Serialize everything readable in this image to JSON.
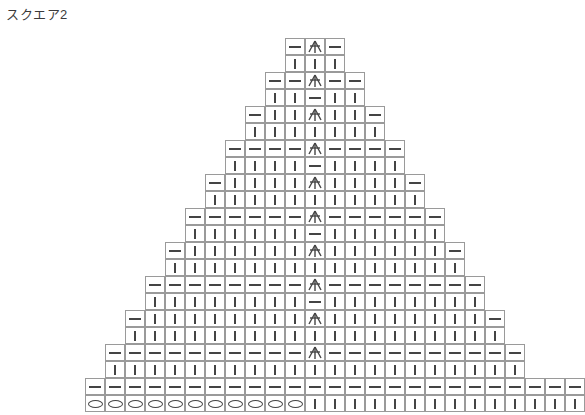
{
  "title": "スクエア2",
  "colors": {
    "background": "#ffffff",
    "grid_line": "#9a9a9a",
    "symbol": "#444444",
    "title_text": "#3a3a3a"
  },
  "symbols": {
    "dash": {
      "name": "half-double-crochet-dash",
      "glyph": "—"
    },
    "bar": {
      "name": "single-crochet-bar",
      "glyph": "|"
    },
    "oval": {
      "name": "chain-stitch-oval",
      "glyph": "O"
    },
    "decrease": {
      "name": "center-double-decrease",
      "glyph": "人"
    }
  },
  "chart_data": {
    "type": "table",
    "title": "スクエア2",
    "xlabel": "",
    "ylabel": "",
    "geometry": {
      "cell_width": 20,
      "cell_height": 17,
      "origin_x": 85,
      "origin_y": 38,
      "rows": 20,
      "left_columns": 11,
      "right_columns": 13,
      "center_column_index": 11
    },
    "legend": [
      {
        "symbol": "dash",
        "label": "—"
      },
      {
        "symbol": "bar",
        "label": "|"
      },
      {
        "symbol": "oval",
        "label": "O"
      },
      {
        "symbol": "decrease",
        "label": "人"
      }
    ],
    "grid": [
      {
        "row": 0,
        "left": [
          "dash"
        ],
        "center": "decrease",
        "right": [
          "dash"
        ]
      },
      {
        "row": 1,
        "left": [
          "bar"
        ],
        "center": "bar",
        "right": [
          "bar"
        ]
      },
      {
        "row": 2,
        "left": [
          "dash",
          "dash"
        ],
        "center": "decrease",
        "right": [
          "dash",
          "dash"
        ]
      },
      {
        "row": 3,
        "left": [
          "bar",
          "bar"
        ],
        "center": "dash",
        "right": [
          "bar",
          "bar"
        ]
      },
      {
        "row": 4,
        "left": [
          "dash",
          "bar",
          "bar"
        ],
        "center": "decrease",
        "right": [
          "bar",
          "bar",
          "dash"
        ]
      },
      {
        "row": 5,
        "left": [
          "bar",
          "bar",
          "bar"
        ],
        "center": "bar",
        "right": [
          "bar",
          "bar",
          "bar"
        ]
      },
      {
        "row": 6,
        "left": [
          "dash",
          "dash",
          "dash",
          "dash"
        ],
        "center": "decrease",
        "right": [
          "dash",
          "dash",
          "dash",
          "dash"
        ]
      },
      {
        "row": 7,
        "left": [
          "bar",
          "bar",
          "bar",
          "bar"
        ],
        "center": "dash",
        "right": [
          "bar",
          "bar",
          "bar",
          "bar"
        ]
      },
      {
        "row": 8,
        "left": [
          "dash",
          "bar",
          "bar",
          "bar",
          "bar"
        ],
        "center": "decrease",
        "right": [
          "bar",
          "bar",
          "bar",
          "bar",
          "dash"
        ]
      },
      {
        "row": 9,
        "left": [
          "bar",
          "bar",
          "bar",
          "bar",
          "bar"
        ],
        "center": "bar",
        "right": [
          "bar",
          "bar",
          "bar",
          "bar",
          "bar"
        ]
      },
      {
        "row": 10,
        "left": [
          "dash",
          "dash",
          "dash",
          "dash",
          "dash",
          "dash"
        ],
        "center": "decrease",
        "right": [
          "dash",
          "dash",
          "dash",
          "dash",
          "dash",
          "dash"
        ]
      },
      {
        "row": 11,
        "left": [
          "bar",
          "bar",
          "bar",
          "bar",
          "bar",
          "bar"
        ],
        "center": "dash",
        "right": [
          "bar",
          "bar",
          "bar",
          "bar",
          "bar",
          "bar"
        ]
      },
      {
        "row": 12,
        "left": [
          "dash",
          "bar",
          "bar",
          "bar",
          "bar",
          "bar",
          "bar"
        ],
        "center": "decrease",
        "right": [
          "bar",
          "bar",
          "bar",
          "bar",
          "bar",
          "bar",
          "dash"
        ]
      },
      {
        "row": 13,
        "left": [
          "bar",
          "bar",
          "bar",
          "bar",
          "bar",
          "bar",
          "bar"
        ],
        "center": "bar",
        "right": [
          "bar",
          "bar",
          "bar",
          "bar",
          "bar",
          "bar",
          "bar"
        ]
      },
      {
        "row": 14,
        "left": [
          "dash",
          "dash",
          "dash",
          "dash",
          "dash",
          "dash",
          "dash",
          "dash"
        ],
        "center": "decrease",
        "right": [
          "dash",
          "dash",
          "dash",
          "dash",
          "dash",
          "dash",
          "dash",
          "dash"
        ]
      },
      {
        "row": 15,
        "left": [
          "bar",
          "bar",
          "bar",
          "bar",
          "bar",
          "bar",
          "bar",
          "bar"
        ],
        "center": "dash",
        "right": [
          "bar",
          "bar",
          "bar",
          "bar",
          "bar",
          "bar",
          "bar",
          "bar"
        ]
      },
      {
        "row": 16,
        "left": [
          "dash",
          "bar",
          "bar",
          "bar",
          "bar",
          "bar",
          "bar",
          "bar",
          "bar"
        ],
        "center": "decrease",
        "right": [
          "bar",
          "bar",
          "bar",
          "bar",
          "bar",
          "bar",
          "bar",
          "bar",
          "dash"
        ]
      },
      {
        "row": 17,
        "left": [
          "bar",
          "bar",
          "bar",
          "bar",
          "bar",
          "bar",
          "bar",
          "bar",
          "bar"
        ],
        "center": "bar",
        "right": [
          "bar",
          "bar",
          "bar",
          "bar",
          "bar",
          "bar",
          "bar",
          "bar",
          "bar"
        ]
      },
      {
        "row": 18,
        "left": [
          "dash",
          "dash",
          "dash",
          "dash",
          "dash",
          "dash",
          "dash",
          "dash",
          "dash",
          "dash"
        ],
        "center": "decrease",
        "right": [
          "dash",
          "dash",
          "dash",
          "dash",
          "dash",
          "dash",
          "dash",
          "dash",
          "dash",
          "dash"
        ]
      },
      {
        "row": 19,
        "left": [
          "bar",
          "bar",
          "bar",
          "bar",
          "bar",
          "bar",
          "bar",
          "bar",
          "bar",
          "bar"
        ],
        "center": "bar",
        "right": [
          "bar",
          "bar",
          "bar",
          "bar",
          "bar",
          "bar",
          "bar",
          "bar",
          "bar",
          "bar"
        ]
      },
      {
        "row": 20,
        "left": [
          "dash",
          "dash",
          "dash",
          "dash",
          "dash",
          "dash",
          "dash",
          "dash",
          "dash",
          "dash",
          "dash"
        ],
        "center": "dash",
        "right": [
          "dash",
          "dash",
          "dash",
          "dash",
          "dash",
          "dash",
          "dash",
          "dash",
          "dash",
          "dash",
          "dash",
          "dash",
          "dash"
        ]
      },
      {
        "row": 21,
        "left": [
          "oval",
          "oval",
          "oval",
          "oval",
          "oval",
          "oval",
          "oval",
          "oval",
          "oval",
          "oval",
          "oval"
        ],
        "center": "bar",
        "right": [
          "bar",
          "bar",
          "bar",
          "bar",
          "bar",
          "bar",
          "bar",
          "bar",
          "bar",
          "bar",
          "bar",
          "bar",
          "bar"
        ]
      }
    ]
  }
}
